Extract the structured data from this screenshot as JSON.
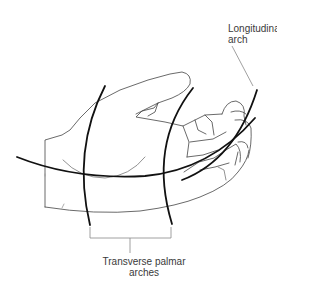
{
  "diagram": {
    "labels": {
      "longitudinal_line1": "Longitudinal",
      "longitudinal_line2": "arch",
      "transverse_line1": "Transverse palmar",
      "transverse_line2": "arches"
    },
    "colors": {
      "arch_stroke": "#111111",
      "outline_stroke": "#444444",
      "leader_stroke": "#888888",
      "text": "#3a3a3a"
    }
  }
}
